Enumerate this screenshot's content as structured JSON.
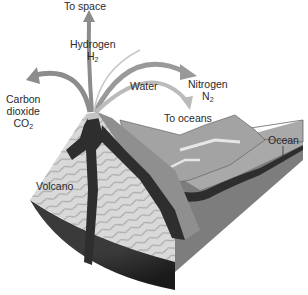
{
  "diagram": {
    "labels": {
      "to_space": "To space",
      "hydrogen": "Hydrogen",
      "hydrogen_formula": "H",
      "hydrogen_sub": "2",
      "carbon_line1": "Carbon",
      "carbon_line2": "dioxide",
      "carbon_formula": "CO",
      "carbon_sub": "2",
      "water": "Water",
      "nitrogen": "Nitrogen",
      "nitrogen_formula": "N",
      "nitrogen_sub": "2",
      "to_oceans": "To oceans",
      "ocean": "Ocean",
      "volcano": "Volcano"
    },
    "arrows": [
      {
        "from": "volcano-vent",
        "to": "space",
        "gas": "Hydrogen H2"
      },
      {
        "from": "volcano-vent",
        "to": "left",
        "gas": "Carbon dioxide CO2"
      },
      {
        "from": "volcano-vent",
        "to": "right",
        "gas": "Nitrogen N2"
      },
      {
        "from": "volcano-vent",
        "to": "oceans",
        "gas": "Water"
      }
    ],
    "colors": {
      "arrow": "#8c8c8c",
      "arrow_light": "#b8b8b8",
      "magma": "#2e2e2e",
      "rock_strata": "#d6d6d6",
      "strata_lines": "#9a9a9a",
      "land": "#a8a8a8",
      "ocean_floor": "#8a8a8a",
      "block_side": "#7a7a7a"
    }
  }
}
